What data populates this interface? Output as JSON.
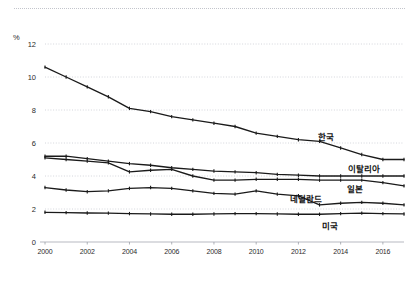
{
  "figure": {
    "unit_label": "%",
    "background": "#ffffff",
    "line_color": "#1a1a1a",
    "grid_color": "#c9ccd3"
  },
  "axes": {
    "y_ticks": [
      "12",
      "10",
      "8",
      "6",
      "4",
      "2",
      "0"
    ],
    "y_values": [
      12,
      10,
      8,
      6,
      4,
      2,
      0
    ],
    "x_ticks": [
      "2000",
      "2002",
      "2004",
      "2006",
      "2008",
      "2010",
      "2012",
      "2014",
      "2016"
    ],
    "x_tick_values": [
      2000,
      2002,
      2004,
      2006,
      2008,
      2010,
      2012,
      2014,
      2016
    ]
  },
  "series_labels": {
    "korea": "한국",
    "italy": "이탈리아",
    "japan": "일본",
    "netherlands": "네덜란드",
    "usa": "미국"
  },
  "chart_data": {
    "type": "line",
    "title": "",
    "xlabel": "",
    "ylabel": "%",
    "xlim": [
      2000,
      2017
    ],
    "ylim": [
      0,
      12
    ],
    "grid": true,
    "legend": "inline-end-labels",
    "x": [
      2000,
      2001,
      2002,
      2003,
      2004,
      2005,
      2006,
      2007,
      2008,
      2009,
      2010,
      2011,
      2012,
      2013,
      2014,
      2015,
      2016,
      2017
    ],
    "series": [
      {
        "name": "한국",
        "values": [
          10.6,
          10.0,
          9.4,
          8.8,
          8.1,
          7.9,
          7.6,
          7.4,
          7.2,
          7.0,
          6.6,
          6.4,
          6.2,
          6.1,
          5.7,
          5.3,
          5.0,
          5.0
        ]
      },
      {
        "name": "이탈리아",
        "values": [
          5.2,
          5.2,
          5.05,
          4.9,
          4.75,
          4.65,
          4.5,
          4.4,
          4.3,
          4.25,
          4.2,
          4.1,
          4.05,
          4.0,
          4.0,
          4.0,
          4.0,
          4.0
        ]
      },
      {
        "name": "일본",
        "values": [
          5.1,
          5.0,
          4.9,
          4.8,
          4.25,
          4.35,
          4.4,
          4.0,
          3.75,
          3.75,
          3.8,
          3.8,
          3.8,
          3.75,
          3.75,
          3.75,
          3.6,
          3.4
        ]
      },
      {
        "name": "네덜란드",
        "values": [
          3.3,
          3.15,
          3.05,
          3.1,
          3.25,
          3.3,
          3.25,
          3.1,
          2.95,
          2.9,
          3.1,
          2.9,
          2.8,
          2.25,
          2.35,
          2.4,
          2.35,
          2.25
        ]
      },
      {
        "name": "미국",
        "values": [
          1.8,
          1.78,
          1.76,
          1.75,
          1.72,
          1.7,
          1.68,
          1.68,
          1.7,
          1.72,
          1.72,
          1.7,
          1.68,
          1.68,
          1.72,
          1.75,
          1.72,
          1.7
        ]
      }
    ]
  }
}
